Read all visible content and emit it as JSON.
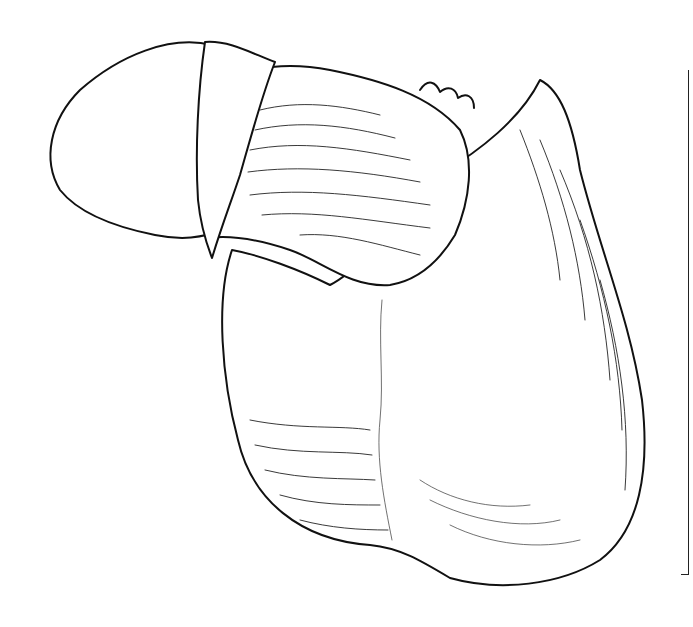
{
  "illustration": {
    "subject": "anatomical line illustration",
    "style": "black ink line art",
    "colors": {
      "ink": "#111111",
      "paper": "#ffffff"
    }
  }
}
